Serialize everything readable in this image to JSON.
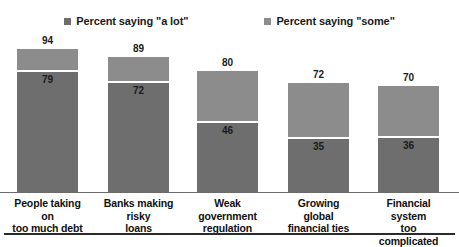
{
  "legend": {
    "items": [
      {
        "label": "Percent saying \"a lot\"",
        "color": "#6e6e6e",
        "swatch_icon": "square-swatch-icon"
      },
      {
        "label": "Percent saying \"some\"",
        "color": "#8c8c8c",
        "swatch_icon": "square-swatch-icon"
      }
    ]
  },
  "colors": {
    "a_lot": "#6e6e6e",
    "some": "#8c8c8c",
    "divider": "#ffffff",
    "axis": "#6b6b6b",
    "rule": "#2b2b2b",
    "text": "#111111",
    "background": "#ffffff"
  },
  "chart_data": {
    "type": "bar",
    "stacked": true,
    "title": "",
    "subtitle": "",
    "xlabel": "",
    "ylabel": "",
    "ylim": [
      0,
      100
    ],
    "grid": false,
    "legend_position": "top-center",
    "categories": [
      "People taking on too much debt",
      "Banks making risky loans",
      "Weak government regulation",
      "Growing global financial ties",
      "Financial system too complicated"
    ],
    "series": [
      {
        "name": "Percent saying \"a lot\"",
        "values": [
          79,
          72,
          46,
          35,
          36
        ]
      },
      {
        "name": "Percent saying \"some\"",
        "values": [
          15,
          17,
          34,
          37,
          34
        ]
      }
    ],
    "totals": [
      94,
      89,
      80,
      72,
      70
    ],
    "bars": [
      {
        "category": "People taking on too much debt",
        "label_line1": "People taking on",
        "label_line2": "too much debt",
        "total": 94,
        "a_lot": 79,
        "some": 15
      },
      {
        "category": "Banks making risky loans",
        "label_line1": "Banks making risky",
        "label_line2": "loans",
        "total": 89,
        "a_lot": 72,
        "some": 17
      },
      {
        "category": "Weak government regulation",
        "label_line1": "Weak government",
        "label_line2": "regulation",
        "total": 80,
        "a_lot": 46,
        "some": 34
      },
      {
        "category": "Growing global financial ties",
        "label_line1": "Growing global",
        "label_line2": "financial ties",
        "total": 72,
        "a_lot": 35,
        "some": 37
      },
      {
        "category": "Financial system too complicated",
        "label_line1": "Financial system",
        "label_line2": "too complicated",
        "total": 70,
        "a_lot": 36,
        "some": 34
      }
    ]
  }
}
